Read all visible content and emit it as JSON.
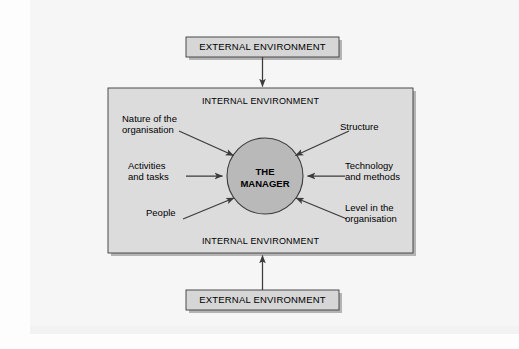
{
  "figure": {
    "caption": ""
  },
  "external_top": {
    "label": "EXTERNAL ENVIRONMENT"
  },
  "external_bottom": {
    "label": "EXTERNAL ENVIRONMENT"
  },
  "internal": {
    "label_top": "INTERNAL ENVIRONMENT",
    "label_bottom": "INTERNAL ENVIRONMENT"
  },
  "center": {
    "label": "THE\nMANAGER"
  },
  "factors_left": [
    {
      "label": "Nature of the\norganisation"
    },
    {
      "label": "Activities\nand tasks"
    },
    {
      "label": "People"
    }
  ],
  "factors_right": [
    {
      "label": "Structure"
    },
    {
      "label": "Technology\nand methods"
    },
    {
      "label": "Level in the\norganisation"
    }
  ],
  "colors": {
    "page_background": "#fdfdfd",
    "scan_panel": "#f6f6f6",
    "box_fill": "#d6d6d6",
    "internal_fill": "#dcdcdc",
    "circle_fill": "#b9b9b9",
    "stroke": "#3b3b3b",
    "shadow": "#b4b4b4",
    "text": "#000000"
  }
}
